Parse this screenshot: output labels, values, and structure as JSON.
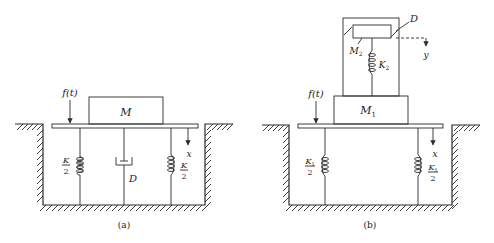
{
  "figure_a": {
    "caption": "(a)",
    "mass_label": "M",
    "force_label": "f(t)",
    "displacement_label": "x",
    "damper_label": "D",
    "spring_left": {
      "numerator": "K",
      "denominator": "2"
    },
    "spring_right": {
      "numerator": "K",
      "denominator": "2"
    }
  },
  "figure_b": {
    "caption": "(b)",
    "mass1_label": "M",
    "mass1_sub": "1",
    "mass2_label": "M",
    "mass2_sub": "2",
    "spring2_label": "K",
    "spring2_sub": "2",
    "damper_label": "D",
    "force_label": "f(t)",
    "displacement_x_label": "x",
    "displacement_y_label": "y",
    "spring_left": {
      "numerator": "K",
      "num_sub": "1",
      "denominator": "2"
    },
    "spring_right": {
      "numerator": "K",
      "num_sub": "1",
      "denominator": "2"
    }
  },
  "colors": {
    "ink": "#2a2a2a",
    "background": "#ffffff"
  }
}
